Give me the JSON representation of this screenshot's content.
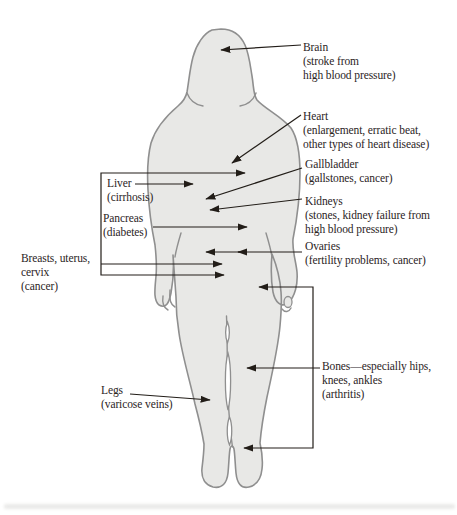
{
  "palette": {
    "background": "#ffffff",
    "body_fill": "#e8e8e6",
    "body_outline": "#8f8f8f",
    "leader_line": "#221d18",
    "text": "#2b241e"
  },
  "labels": {
    "brain": {
      "lines": [
        "Brain",
        "(stroke from",
        "high blood pressure)"
      ]
    },
    "heart": {
      "lines": [
        "Heart",
        "(enlargement, erratic beat,",
        "other types of heart disease)"
      ]
    },
    "gallbladder": {
      "lines": [
        "Gallbladder",
        "(gallstones, cancer)"
      ]
    },
    "kidneys": {
      "lines": [
        "Kidneys",
        "(stones, kidney failure from",
        "high blood pressure)"
      ]
    },
    "ovaries": {
      "lines": [
        "Ovaries",
        "(fertility problems, cancer)"
      ]
    },
    "liver": {
      "lines": [
        "Liver",
        "(cirrhosis)"
      ]
    },
    "pancreas": {
      "lines": [
        "Pancreas",
        "(diabetes)"
      ]
    },
    "breasts": {
      "lines": [
        "Breasts, uterus,",
        "cervix",
        "(cancer)"
      ]
    },
    "legs": {
      "lines": [
        "Legs",
        "(varicose veins)"
      ]
    },
    "bones": {
      "lines": [
        "Bones—especially hips,",
        "knees, ankles",
        "(arthritis)"
      ]
    }
  }
}
